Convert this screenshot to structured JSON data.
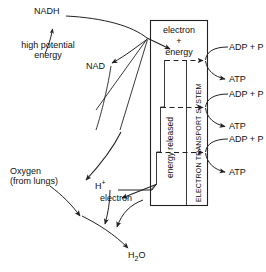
{
  "diagram": {
    "title": "Electron Transport System",
    "stroke_color": "#222222",
    "background": "#ffffff",
    "box": {
      "label_top_line1": "electron",
      "label_top_plus": "+",
      "label_top_line2": "energy",
      "vertical_label_left": "energy  released",
      "vertical_label_right": "ELECTRON  TRANSPORT  SYSTEM"
    },
    "labels": {
      "nadh": "NADH",
      "high_potential_energy_line1": "high potential",
      "high_potential_energy_line2": "energy",
      "nad": "NAD",
      "oxygen_line1": "Oxygen",
      "oxygen_line2": "(from lungs)",
      "proton": "H",
      "proton_charge": "+",
      "electron": "electron",
      "water": "H",
      "water_sub": "2",
      "water_o": "O"
    },
    "atp_stages": [
      {
        "input": "ADP + P",
        "output": "ATP"
      },
      {
        "input": "ADP + P",
        "output": "ATP"
      },
      {
        "input": "ADP + P",
        "output": "ATP"
      }
    ]
  }
}
